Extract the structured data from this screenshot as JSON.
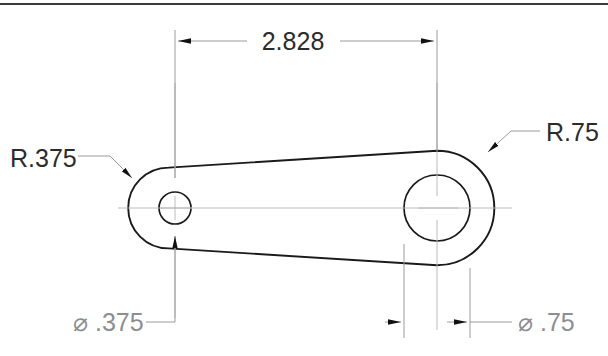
{
  "drawing": {
    "title": "Mechanical part dimensioned drawing",
    "background_color": "#ffffff",
    "outline_color": "#1a1a1a",
    "dimension_color": "#9a9aa0",
    "text_color": "#2b2b2b",
    "light_text_color": "#8d8d92",
    "border": {
      "name": "top-border-rule",
      "color": "#3a3a3a"
    },
    "dimensions": [
      {
        "id": "center-distance",
        "label": "2.828",
        "type": "linear-horizontal",
        "placement": "top",
        "arrows": "outward",
        "from_feature": "small-hole-center",
        "to_feature": "large-hole-center"
      },
      {
        "id": "small-fillet-radius",
        "label": "R.375",
        "type": "radius-leader",
        "placement": "left",
        "points_to": "left-boss-outer-arc"
      },
      {
        "id": "large-fillet-radius",
        "label": "R.75",
        "type": "radius-leader",
        "placement": "right",
        "points_to": "right-boss-outer-arc"
      },
      {
        "id": "small-hole-diameter",
        "label": "⌀ .375",
        "type": "diameter-leader",
        "placement": "bottom-left",
        "points_to": "small-hole"
      },
      {
        "id": "large-hole-diameter",
        "label": "⌀ .75",
        "type": "diameter-linear",
        "placement": "bottom-right",
        "arrows": "outward",
        "points_to": "large-hole"
      }
    ],
    "features": [
      {
        "id": "small-hole",
        "name": "small-hole",
        "shape": "circle"
      },
      {
        "id": "large-hole",
        "name": "large-hole",
        "shape": "circle"
      },
      {
        "id": "left-boss-outer-arc",
        "name": "left-boss-outer-arc",
        "shape": "arc"
      },
      {
        "id": "right-boss-outer-arc",
        "name": "right-boss-outer-arc",
        "shape": "arc"
      },
      {
        "id": "body-outline",
        "name": "part-outline",
        "shape": "closed-path"
      }
    ]
  }
}
